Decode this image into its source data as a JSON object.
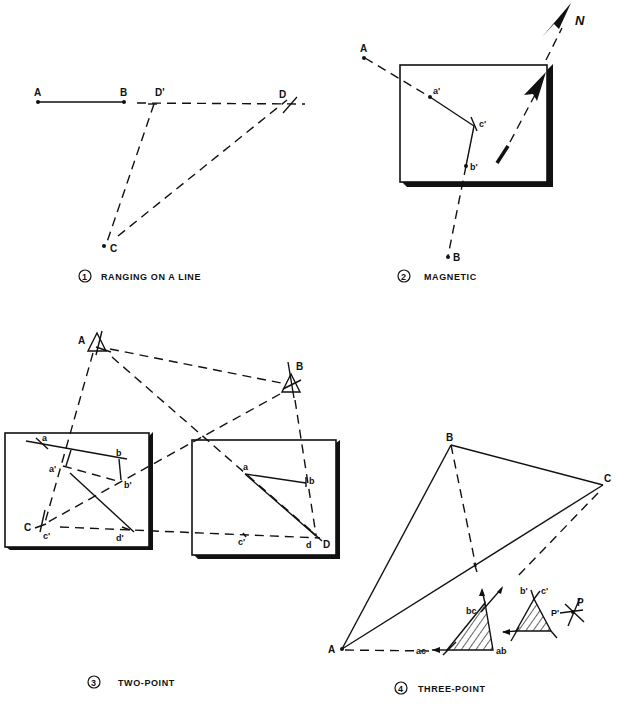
{
  "figure": {
    "colors": {
      "ink": "#111111",
      "paper": "#ffffff"
    }
  },
  "panels": [
    {
      "id": 1,
      "number": "1",
      "caption": "RANGING ON A LINE",
      "points": {
        "A": "A",
        "B": "B",
        "D_prime": "D'",
        "D": "D",
        "C": "C"
      }
    },
    {
      "id": 2,
      "number": "2",
      "caption": "MAGNETIC",
      "points": {
        "A": "A",
        "B": "B",
        "a_prime": "a'",
        "b_prime": "b'",
        "c_prime": "c'",
        "north": "N"
      }
    },
    {
      "id": 3,
      "number": "3",
      "caption": "TWO-POINT",
      "points": {
        "A": "A",
        "B": "B",
        "C": "C",
        "D": "D",
        "left_board": {
          "a": "a",
          "b": "b",
          "a_prime": "a'",
          "b_prime": "b'",
          "c_prime": "c'",
          "d_prime": "d'"
        },
        "right_board": {
          "a": "a",
          "b": "b",
          "c_prime": "c'",
          "d": "d"
        }
      }
    },
    {
      "id": 4,
      "number": "4",
      "caption": "THREE-POINT",
      "points": {
        "A": "A",
        "B": "B",
        "C": "C",
        "ac": "ac",
        "ab": "ab",
        "bc": "bc",
        "b_prime": "b'",
        "c_prime": "c'",
        "P_prime": "P'",
        "P": "P"
      }
    }
  ]
}
